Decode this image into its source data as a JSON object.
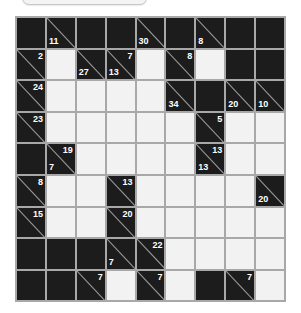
{
  "puzzle": {
    "type": "kakuro",
    "rows": 9,
    "cols": 9,
    "colors": {
      "black": "#1c1c1c",
      "white": "#f2f2f2",
      "grid_line": "#a8a8a8",
      "clue_text": "#ffffff"
    },
    "grid": [
      [
        {
          "t": "b"
        },
        {
          "t": "c",
          "down": "11"
        },
        {
          "t": "b"
        },
        {
          "t": "b"
        },
        {
          "t": "c",
          "down": "30"
        },
        {
          "t": "b"
        },
        {
          "t": "c",
          "down": "8"
        },
        {
          "t": "b"
        },
        {
          "t": "b"
        }
      ],
      [
        {
          "t": "c",
          "right": "2"
        },
        {
          "t": "w"
        },
        {
          "t": "c",
          "down": "27"
        },
        {
          "t": "c",
          "down": "13",
          "right": "7"
        },
        {
          "t": "w"
        },
        {
          "t": "c",
          "right": "8"
        },
        {
          "t": "w"
        },
        {
          "t": "b"
        },
        {
          "t": "b"
        }
      ],
      [
        {
          "t": "c",
          "right": "24"
        },
        {
          "t": "w"
        },
        {
          "t": "w"
        },
        {
          "t": "w"
        },
        {
          "t": "w"
        },
        {
          "t": "c",
          "down": "34"
        },
        {
          "t": "b"
        },
        {
          "t": "c",
          "down": "20"
        },
        {
          "t": "c",
          "down": "10"
        }
      ],
      [
        {
          "t": "c",
          "right": "23"
        },
        {
          "t": "w"
        },
        {
          "t": "w"
        },
        {
          "t": "w"
        },
        {
          "t": "w"
        },
        {
          "t": "w"
        },
        {
          "t": "c",
          "right": "5"
        },
        {
          "t": "w"
        },
        {
          "t": "w"
        }
      ],
      [
        {
          "t": "b"
        },
        {
          "t": "c",
          "down": "7",
          "right": "19"
        },
        {
          "t": "w"
        },
        {
          "t": "w"
        },
        {
          "t": "w"
        },
        {
          "t": "w"
        },
        {
          "t": "c",
          "down": "13",
          "right": "13"
        },
        {
          "t": "w"
        },
        {
          "t": "w"
        }
      ],
      [
        {
          "t": "c",
          "right": "8"
        },
        {
          "t": "w"
        },
        {
          "t": "w"
        },
        {
          "t": "c",
          "right": "13"
        },
        {
          "t": "w"
        },
        {
          "t": "w"
        },
        {
          "t": "w"
        },
        {
          "t": "w"
        },
        {
          "t": "c",
          "down": "20"
        }
      ],
      [
        {
          "t": "c",
          "right": "15"
        },
        {
          "t": "w"
        },
        {
          "t": "w"
        },
        {
          "t": "c",
          "right": "20"
        },
        {
          "t": "w"
        },
        {
          "t": "w"
        },
        {
          "t": "w"
        },
        {
          "t": "w"
        },
        {
          "t": "w"
        }
      ],
      [
        {
          "t": "b"
        },
        {
          "t": "b"
        },
        {
          "t": "b"
        },
        {
          "t": "c",
          "down": "7"
        },
        {
          "t": "c",
          "right": "22"
        },
        {
          "t": "w"
        },
        {
          "t": "w"
        },
        {
          "t": "w"
        },
        {
          "t": "w"
        }
      ],
      [
        {
          "t": "b"
        },
        {
          "t": "b"
        },
        {
          "t": "c",
          "right": "7"
        },
        {
          "t": "w"
        },
        {
          "t": "c",
          "right": "7"
        },
        {
          "t": "w"
        },
        {
          "t": "b"
        },
        {
          "t": "c",
          "right": "7"
        },
        {
          "t": "w"
        }
      ]
    ]
  }
}
